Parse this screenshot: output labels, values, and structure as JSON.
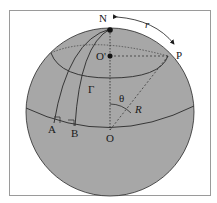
{
  "diagram": {
    "colors": {
      "sphere_fill": "#a7a7a7",
      "stroke": "#2a2a2a",
      "frame": "#9a9a9a",
      "background": "#ffffff"
    },
    "labels": {
      "north_pole": "N",
      "point_p": "P",
      "cap_center": "O'",
      "sphere_center": "O",
      "point_a": "A",
      "point_b": "B",
      "curve": "Γ",
      "angle": "θ",
      "radius": "R",
      "arc_length": "r"
    }
  }
}
